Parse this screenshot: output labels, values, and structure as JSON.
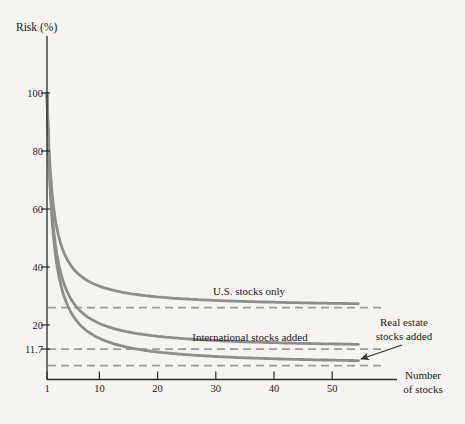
{
  "figure": {
    "y_axis_title": "Risk (%)",
    "x_axis_title_line1": "Number",
    "x_axis_title_line2": "of stocks"
  },
  "labels": {
    "us": "U.S. stocks only",
    "intl": "International stocks added",
    "re_line1": "Real estate",
    "re_line2": "stocks added"
  },
  "colors": {
    "background": "#f5f4f1",
    "axis": "#2a2a2a",
    "text": "#1a1a1a",
    "curve": "#8d8d8d",
    "dashed": "#9a9a9a",
    "arrow": "#333333"
  },
  "chart_data": {
    "type": "line",
    "title": "",
    "ylabel": "Risk (%)",
    "xlabel": "Number of stocks",
    "grid": false,
    "legend_position": "inline-labels",
    "x_ticks": [
      1,
      10,
      20,
      30,
      40,
      50
    ],
    "y_ticks": [
      100,
      80,
      60,
      40,
      20,
      11.7
    ],
    "xlim": [
      1,
      60
    ],
    "ylim": [
      0,
      118
    ],
    "series": [
      {
        "name": "U.S. stocks only",
        "slug": "us-stocks-only",
        "start_x": 1,
        "start_y": 100,
        "asymptote": 26,
        "x_end": 54.5,
        "points": [
          [
            1,
            100
          ],
          [
            2,
            63.0
          ],
          [
            3,
            50.7
          ],
          [
            5,
            40.8
          ],
          [
            7,
            36.6
          ],
          [
            10,
            33.4
          ],
          [
            15,
            30.9
          ],
          [
            20,
            29.7
          ],
          [
            30,
            28.5
          ],
          [
            40,
            27.9
          ],
          [
            50,
            27.5
          ],
          [
            54,
            27.4
          ]
        ]
      },
      {
        "name": "International stocks added",
        "slug": "international-stocks-added",
        "start_x": 1,
        "start_y": 100,
        "asymptote": 11.7,
        "x_end": 54.5,
        "points": [
          [
            1,
            100
          ],
          [
            2,
            55.9
          ],
          [
            3,
            41.1
          ],
          [
            5,
            29.4
          ],
          [
            7,
            24.3
          ],
          [
            10,
            20.5
          ],
          [
            15,
            17.6
          ],
          [
            20,
            16.1
          ],
          [
            30,
            14.6
          ],
          [
            40,
            13.9
          ],
          [
            50,
            13.5
          ],
          [
            54,
            13.3
          ]
        ]
      },
      {
        "name": "Real estate stocks added",
        "slug": "real-estate-stocks-added",
        "start_x": 1,
        "start_y": 100,
        "asymptote": 6,
        "x_end": 54.5,
        "points": [
          [
            1,
            100
          ],
          [
            2,
            53.0
          ],
          [
            3,
            37.3
          ],
          [
            5,
            24.8
          ],
          [
            7,
            19.4
          ],
          [
            10,
            15.4
          ],
          [
            15,
            12.3
          ],
          [
            20,
            10.7
          ],
          [
            30,
            9.1
          ],
          [
            40,
            8.4
          ],
          [
            50,
            7.9
          ],
          [
            54,
            7.7
          ]
        ]
      }
    ],
    "dashed_reference_lines": [
      {
        "y": 26,
        "x_start": 1,
        "x_end": 59,
        "meaning": "U.S. stocks only asymptote"
      },
      {
        "y": 11.7,
        "x_start": 1,
        "x_end": 59,
        "meaning": "International stocks added asymptote"
      },
      {
        "y": 6,
        "x_start": 1,
        "x_end": 59,
        "meaning": "Real estate stocks added asymptote"
      }
    ],
    "labeled_y_value": 11.7
  }
}
